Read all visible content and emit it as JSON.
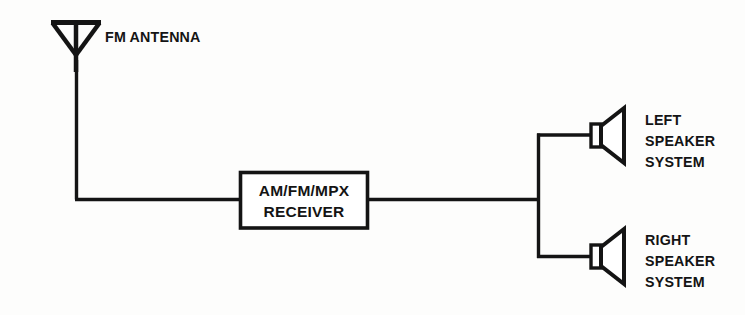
{
  "diagram": {
    "background_color": "#fdfdfc",
    "line_color": "#141414",
    "antenna": {
      "icon": "fm-dipole-antenna-icon",
      "label": "FM ANTENNA"
    },
    "receiver": {
      "label_line1": "AM/FM/MPX",
      "label_line2": "RECEIVER",
      "label": "AM/FM/MPX\nRECEIVER"
    },
    "speakers": [
      {
        "icon": "speaker-icon",
        "label": "LEFT\nSPEAKER\nSYSTEM",
        "line1": "LEFT",
        "line2": "SPEAKER",
        "line3": "SYSTEM"
      },
      {
        "icon": "speaker-icon",
        "label": "RIGHT\nSPEAKER\nSYSTEM",
        "line1": "RIGHT",
        "line2": "SPEAKER",
        "line3": "SYSTEM"
      }
    ],
    "connections": [
      "antenna-to-receiver",
      "receiver-to-speaker-bus",
      "bus-to-left-speaker",
      "bus-to-right-speaker"
    ]
  }
}
